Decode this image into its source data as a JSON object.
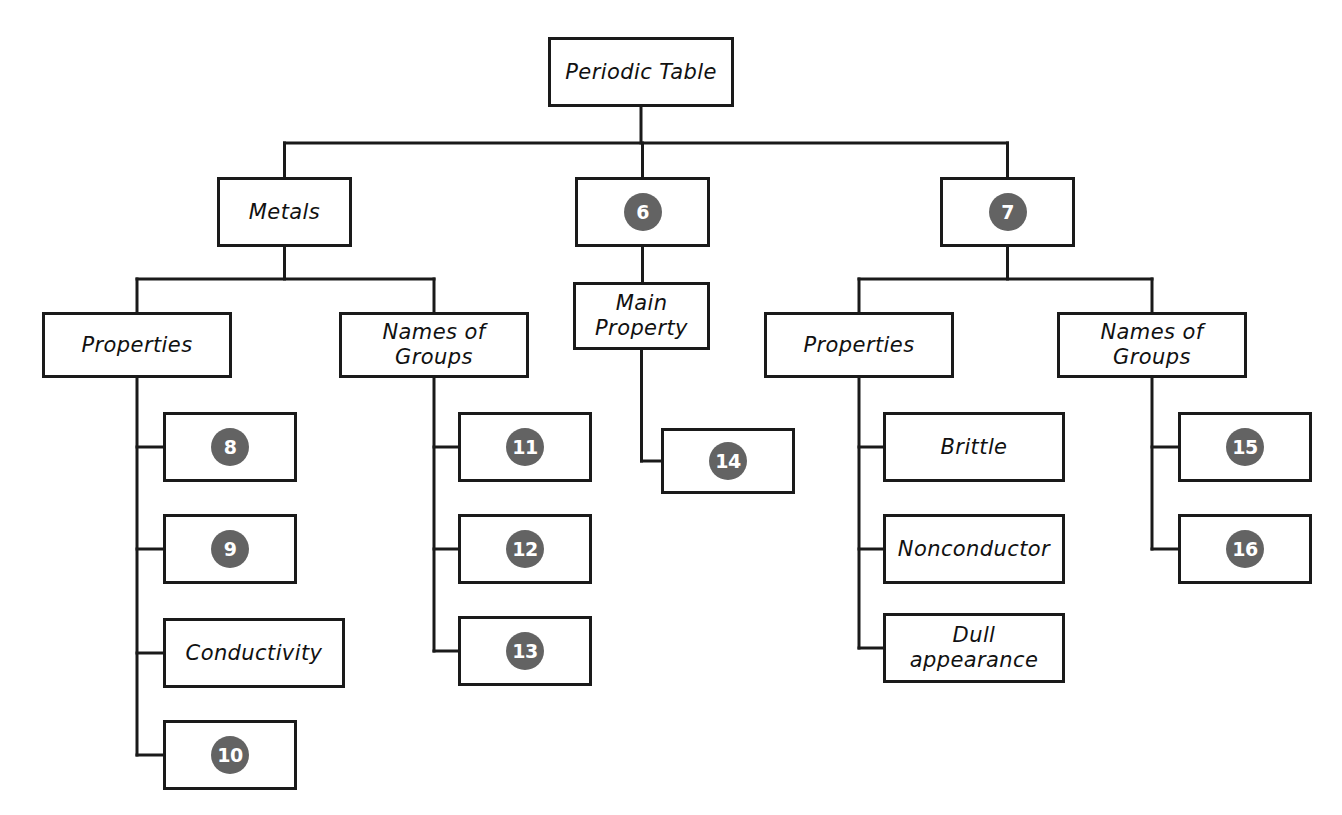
{
  "diagram": {
    "type": "hierarchy-tree",
    "title_node": {
      "id": "root",
      "label": "Periodic Table"
    },
    "nodes": [
      {
        "id": "root",
        "label": "Periodic Table",
        "kind": "text",
        "x": 548,
        "y": 37,
        "w": 186,
        "h": 70
      },
      {
        "id": "metals",
        "label": "Metals",
        "kind": "text",
        "x": 217,
        "y": 177,
        "w": 135,
        "h": 70
      },
      {
        "id": "n6",
        "label": "6",
        "kind": "badge",
        "x": 575,
        "y": 177,
        "w": 135,
        "h": 70
      },
      {
        "id": "n7",
        "label": "7",
        "kind": "badge",
        "x": 940,
        "y": 177,
        "w": 135,
        "h": 70
      },
      {
        "id": "metals-props",
        "label": "Properties",
        "kind": "text",
        "x": 42,
        "y": 312,
        "w": 190,
        "h": 66
      },
      {
        "id": "metals-groups",
        "label": "Names of\nGroups",
        "kind": "text",
        "x": 339,
        "y": 312,
        "w": 190,
        "h": 66
      },
      {
        "id": "main-property",
        "label": "Main\nProperty",
        "kind": "text",
        "x": 573,
        "y": 282,
        "w": 137,
        "h": 68
      },
      {
        "id": "nm-props",
        "label": "Properties",
        "kind": "text",
        "x": 764,
        "y": 312,
        "w": 190,
        "h": 66
      },
      {
        "id": "nm-groups",
        "label": "Names of\nGroups",
        "kind": "text",
        "x": 1057,
        "y": 312,
        "w": 190,
        "h": 66
      },
      {
        "id": "n8",
        "label": "8",
        "kind": "badge",
        "x": 163,
        "y": 412,
        "w": 134,
        "h": 70
      },
      {
        "id": "n9",
        "label": "9",
        "kind": "badge",
        "x": 163,
        "y": 514,
        "w": 134,
        "h": 70
      },
      {
        "id": "conductivity",
        "label": "Conductivity",
        "kind": "text",
        "x": 163,
        "y": 618,
        "w": 182,
        "h": 70
      },
      {
        "id": "n10",
        "label": "10",
        "kind": "badge",
        "x": 163,
        "y": 720,
        "w": 134,
        "h": 70
      },
      {
        "id": "n11",
        "label": "11",
        "kind": "badge",
        "x": 458,
        "y": 412,
        "w": 134,
        "h": 70
      },
      {
        "id": "n12",
        "label": "12",
        "kind": "badge",
        "x": 458,
        "y": 514,
        "w": 134,
        "h": 70
      },
      {
        "id": "n13",
        "label": "13",
        "kind": "badge",
        "x": 458,
        "y": 616,
        "w": 134,
        "h": 70
      },
      {
        "id": "n14",
        "label": "14",
        "kind": "badge",
        "x": 661,
        "y": 428,
        "w": 134,
        "h": 66
      },
      {
        "id": "brittle",
        "label": "Brittle",
        "kind": "text",
        "x": 883,
        "y": 412,
        "w": 182,
        "h": 70
      },
      {
        "id": "nonconductor",
        "label": "Nonconductor",
        "kind": "text",
        "x": 883,
        "y": 514,
        "w": 182,
        "h": 70
      },
      {
        "id": "dull",
        "label": "Dull\nappearance",
        "kind": "text",
        "x": 883,
        "y": 613,
        "w": 182,
        "h": 70
      },
      {
        "id": "n15",
        "label": "15",
        "kind": "badge",
        "x": 1178,
        "y": 412,
        "w": 134,
        "h": 70
      },
      {
        "id": "n16",
        "label": "16",
        "kind": "badge",
        "x": 1178,
        "y": 514,
        "w": 134,
        "h": 70
      }
    ],
    "edges": [
      {
        "from": "root",
        "to": "metals"
      },
      {
        "from": "root",
        "to": "n6"
      },
      {
        "from": "root",
        "to": "n7"
      },
      {
        "from": "metals",
        "to": "metals-props"
      },
      {
        "from": "metals",
        "to": "metals-groups"
      },
      {
        "from": "n6",
        "to": "main-property"
      },
      {
        "from": "n7",
        "to": "nm-props"
      },
      {
        "from": "n7",
        "to": "nm-groups"
      },
      {
        "from": "metals-props",
        "to": "n8"
      },
      {
        "from": "metals-props",
        "to": "n9"
      },
      {
        "from": "metals-props",
        "to": "conductivity"
      },
      {
        "from": "metals-props",
        "to": "n10"
      },
      {
        "from": "metals-groups",
        "to": "n11"
      },
      {
        "from": "metals-groups",
        "to": "n12"
      },
      {
        "from": "metals-groups",
        "to": "n13"
      },
      {
        "from": "main-property",
        "to": "n14"
      },
      {
        "from": "nm-props",
        "to": "brittle"
      },
      {
        "from": "nm-props",
        "to": "nonconductor"
      },
      {
        "from": "nm-props",
        "to": "dull"
      },
      {
        "from": "nm-groups",
        "to": "n15"
      },
      {
        "from": "nm-groups",
        "to": "n16"
      }
    ],
    "colors": {
      "stroke": "#1a1a1a",
      "badge_fill": "#636363",
      "badge_text": "#ffffff",
      "box_fill": "#ffffff",
      "background": "#ffffff"
    }
  }
}
